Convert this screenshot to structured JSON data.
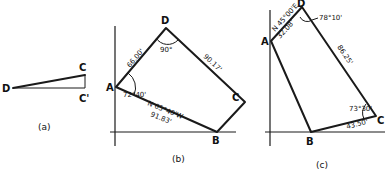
{
  "panels": {
    "a": {
      "caption": "(a)",
      "points": {
        "D": "D",
        "C": "C",
        "C_prime": "C'"
      }
    },
    "b": {
      "caption": "(b)",
      "points": {
        "A": "A",
        "B": "B",
        "C": "C",
        "D": "D"
      },
      "labels": {
        "AD_length": "66.00'",
        "angle_D": "90°",
        "DC_length": "90.17'",
        "angle_A": "72°40'",
        "AB_bearing": "N 65°40'W",
        "AB_length": "91.83'"
      }
    },
    "c": {
      "caption": "(c)",
      "points": {
        "A": "A",
        "B": "B",
        "C": "C",
        "D": "D"
      },
      "labels": {
        "AD_bearing": "N 45°00'E",
        "AD_length": "32.08'",
        "angle_D": "78°10'",
        "DC_length": "86.25'",
        "angle_C": "73°30'",
        "BC_length": "43.50'"
      }
    }
  },
  "colors": {
    "ink": "#1a1a1a",
    "background": "#ffffff"
  }
}
